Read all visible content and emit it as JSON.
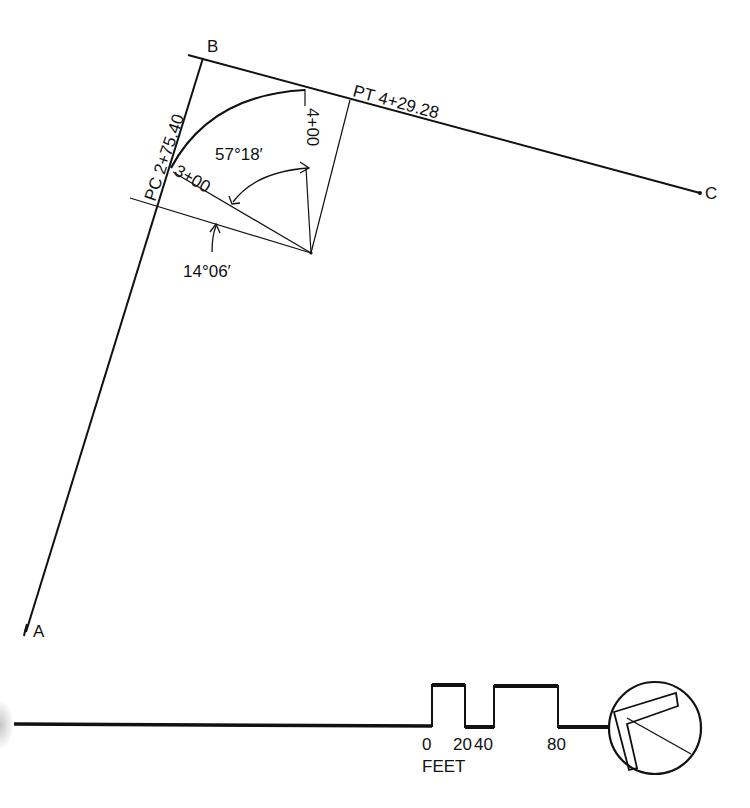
{
  "diagram": {
    "type": "horizontal-curve-survey",
    "colors": {
      "ink": "#111111",
      "background": "#ffffff"
    },
    "points": {
      "A": {
        "label": "A"
      },
      "B": {
        "label": "B"
      },
      "C": {
        "label": "C"
      }
    },
    "curve": {
      "pc_label": "PC 2+75.40",
      "pt_label": "PT 4+29.28",
      "station_300": "3+00",
      "station_400": "4+00",
      "central_angle": "57°18′",
      "deflection_angle": "14°06′"
    },
    "scale_bar": {
      "ticks": [
        "0",
        "20",
        "40",
        "80"
      ],
      "unit": "FEET"
    },
    "north_arrow": {
      "icon": "north-arrow-icon"
    }
  }
}
